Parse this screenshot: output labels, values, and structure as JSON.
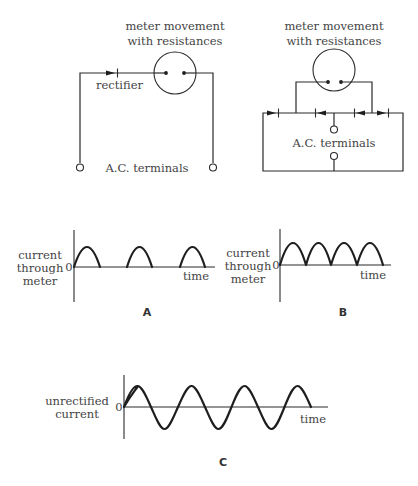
{
  "circuits": {
    "half_wave": {
      "meter_label_line1": "meter movement",
      "meter_label_line2": "with resistances",
      "rectifier_label": "rectifier",
      "terminals_label": "A.C. terminals"
    },
    "bridge": {
      "meter_label_line1": "meter movement",
      "meter_label_line2": "with resistances",
      "terminals_label": "A.C. terminals"
    }
  },
  "graphs": {
    "A": {
      "panel_label": "A",
      "ylabel_line1": "current",
      "ylabel_line2": "through",
      "ylabel_line3": "meter",
      "zero_label": "0",
      "xlabel": "time"
    },
    "B": {
      "panel_label": "B",
      "ylabel_line1": "current",
      "ylabel_line2": "through",
      "ylabel_line3": "meter",
      "zero_label": "0",
      "xlabel": "time"
    },
    "C": {
      "panel_label": "C",
      "ylabel_line1": "unrectified",
      "ylabel_line2": "current",
      "zero_label": "0",
      "xlabel": "time"
    }
  },
  "colors": {
    "line": "#2a2a2a",
    "text": "#444444",
    "background": "#ffffff"
  }
}
